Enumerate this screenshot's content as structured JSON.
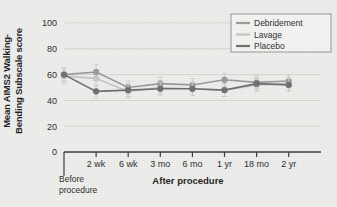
{
  "chart_data": {
    "type": "line",
    "title": "",
    "xlabel": "After procedure",
    "ylabel": "Mean AIMS2 Walking-Bending Subscale score",
    "ylabel_line1": "Mean AIMS2 Walking-",
    "ylabel_line2": "Bending Subscale score",
    "before_label_line1": "Before",
    "before_label_line2": "procedure",
    "categories": [
      "Before procedure",
      "2 wk",
      "6 wk",
      "3 mo",
      "6 mo",
      "1 yr",
      "18 mo",
      "2 yr"
    ],
    "xtick_labels": [
      "",
      "2 wk",
      "6 wk",
      "3 mo",
      "6 mo",
      "1 yr",
      "18 mo",
      "2 yr"
    ],
    "ylim": [
      0,
      100
    ],
    "yticks": [
      0,
      20,
      40,
      60,
      80,
      100
    ],
    "ytick_labels": [
      "0",
      "20",
      "40",
      "60",
      "80",
      "100"
    ],
    "grid": true,
    "legend_position": "top-right",
    "series": [
      {
        "name": "Debridement",
        "color": "#9a9a9a",
        "values": [
          60,
          62,
          50,
          53,
          52,
          56,
          54,
          55
        ],
        "errors": [
          5,
          6,
          5,
          5,
          5,
          5,
          5,
          5
        ]
      },
      {
        "name": "Lavage",
        "color": "#c4c4c4",
        "values": [
          59,
          57,
          47,
          50,
          49,
          48,
          52,
          53
        ],
        "errors": [
          6,
          6,
          5,
          5,
          5,
          5,
          5,
          5
        ]
      },
      {
        "name": "Placebo",
        "color": "#6e6e6e",
        "values": [
          60,
          47,
          48,
          49,
          49,
          48,
          53,
          52
        ],
        "errors": [
          5,
          5,
          5,
          5,
          5,
          5,
          5,
          5
        ]
      }
    ]
  },
  "legend": {
    "items": [
      {
        "label": "Debridement",
        "color": "#9a9a9a"
      },
      {
        "label": "Lavage",
        "color": "#c4c4c4"
      },
      {
        "label": "Placebo",
        "color": "#6e6e6e"
      }
    ]
  }
}
